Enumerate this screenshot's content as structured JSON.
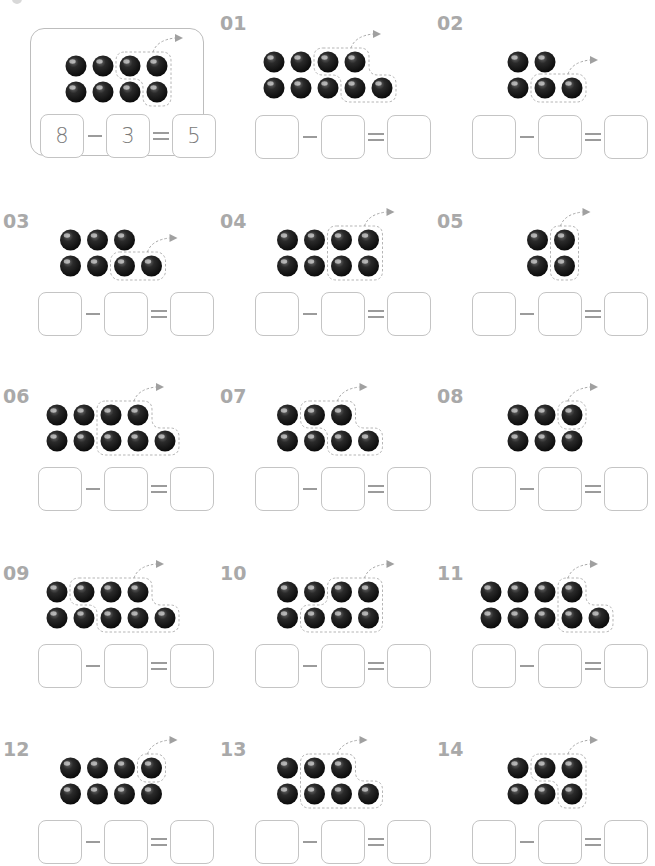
{
  "page": {
    "title_cut_off": "",
    "colors": {
      "ball": "#1a1a1a",
      "label": "#a9a9a9",
      "box_border": "#c4c4c4",
      "dashed_outline": "#b0b0b0"
    }
  },
  "example": {
    "top": 4,
    "bottom": 4,
    "removed_top": [
      2,
      3
    ],
    "removed_bottom": [
      3
    ],
    "answer": {
      "a": "8",
      "b": "3",
      "c": "5"
    },
    "minus": "−",
    "equals": "="
  },
  "problems": [
    {
      "label": "01",
      "top": 4,
      "bottom": 5,
      "removed_top": [
        2,
        3
      ],
      "removed_bottom": [
        3,
        4
      ],
      "top_offset": 0,
      "answer": {
        "a": "",
        "b": "",
        "c": ""
      }
    },
    {
      "label": "02",
      "top": 2,
      "bottom": 3,
      "removed_top": [],
      "removed_bottom": [
        1,
        2
      ],
      "top_offset": 0,
      "answer": {
        "a": "",
        "b": "",
        "c": ""
      }
    },
    {
      "label": "03",
      "top": 3,
      "bottom": 4,
      "removed_top": [],
      "removed_bottom": [
        2,
        3
      ],
      "top_offset": 0,
      "answer": {
        "a": "",
        "b": "",
        "c": ""
      }
    },
    {
      "label": "04",
      "top": 4,
      "bottom": 4,
      "removed_top": [
        2,
        3
      ],
      "removed_bottom": [
        2,
        3
      ],
      "top_offset": 0,
      "answer": {
        "a": "",
        "b": "",
        "c": ""
      }
    },
    {
      "label": "05",
      "top": 2,
      "bottom": 2,
      "removed_top": [
        1
      ],
      "removed_bottom": [
        1
      ],
      "top_offset": 0,
      "answer": {
        "a": "",
        "b": "",
        "c": ""
      }
    },
    {
      "label": "06",
      "top": 4,
      "bottom": 5,
      "removed_top": [
        2,
        3
      ],
      "removed_bottom": [
        2,
        3,
        4
      ],
      "top_offset": 0,
      "answer": {
        "a": "",
        "b": "",
        "c": ""
      }
    },
    {
      "label": "07",
      "top": 3,
      "bottom": 4,
      "removed_top": [
        1,
        2
      ],
      "removed_bottom": [
        2,
        3
      ],
      "top_offset": 0,
      "answer": {
        "a": "",
        "b": "",
        "c": ""
      }
    },
    {
      "label": "08",
      "top": 3,
      "bottom": 3,
      "removed_top": [
        2
      ],
      "removed_bottom": [],
      "top_offset": 0,
      "answer": {
        "a": "",
        "b": "",
        "c": ""
      }
    },
    {
      "label": "09",
      "top": 4,
      "bottom": 5,
      "removed_top": [
        1,
        2,
        3
      ],
      "removed_bottom": [
        2,
        3,
        4
      ],
      "top_offset": 0,
      "answer": {
        "a": "",
        "b": "",
        "c": ""
      }
    },
    {
      "label": "10",
      "top": 4,
      "bottom": 4,
      "removed_top": [
        2,
        3
      ],
      "removed_bottom": [
        1,
        2,
        3
      ],
      "top_offset": 0,
      "answer": {
        "a": "",
        "b": "",
        "c": ""
      }
    },
    {
      "label": "11",
      "top": 4,
      "bottom": 5,
      "removed_top": [
        3
      ],
      "removed_bottom": [
        3,
        4
      ],
      "top_offset": 0,
      "answer": {
        "a": "",
        "b": "",
        "c": ""
      }
    },
    {
      "label": "12",
      "top": 4,
      "bottom": 4,
      "removed_top": [
        3
      ],
      "removed_bottom": [],
      "top_offset": 0,
      "answer": {
        "a": "",
        "b": "",
        "c": ""
      }
    },
    {
      "label": "13",
      "top": 3,
      "bottom": 4,
      "removed_top": [
        1,
        2
      ],
      "removed_bottom": [
        1,
        2,
        3
      ],
      "top_offset": 0,
      "answer": {
        "a": "",
        "b": "",
        "c": ""
      }
    },
    {
      "label": "14",
      "top": 3,
      "bottom": 3,
      "removed_top": [
        1,
        2
      ],
      "removed_bottom": [
        2
      ],
      "top_offset": 0,
      "answer": {
        "a": "",
        "b": "",
        "c": ""
      }
    }
  ],
  "operators": {
    "minus": "−",
    "equals": "="
  }
}
